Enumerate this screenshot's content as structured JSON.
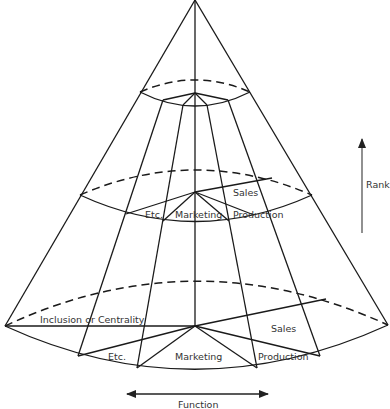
{
  "diagram": {
    "type": "three-dimensional cone model of an organization",
    "colors": {
      "line": "#1a1a1a",
      "text": "#333333",
      "background": "#ffffff"
    },
    "axes": {
      "rank": {
        "label": "Rank",
        "direction": "up"
      },
      "function": {
        "label": "Function",
        "direction": "left-right"
      },
      "inclusion": {
        "label": "Inclusion or Centrality"
      }
    },
    "levels": {
      "top": {
        "labels": []
      },
      "middle": {
        "labels": {
          "etc": "Etc.",
          "marketing": "Marketing",
          "production": "Production",
          "sales": "Sales"
        }
      },
      "bottom": {
        "labels": {
          "etc": "Etc.",
          "marketing": "Marketing",
          "production": "Production",
          "sales": "Sales"
        }
      }
    },
    "corner_mark": "~"
  }
}
